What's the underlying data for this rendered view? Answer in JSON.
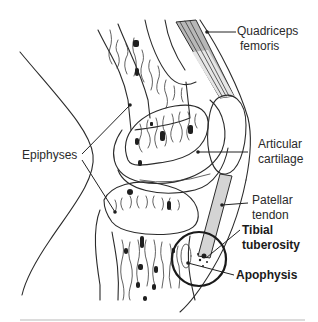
{
  "diagram": {
    "type": "anatomical illustration",
    "labels": {
      "quadriceps": [
        "Quadriceps",
        "femoris"
      ],
      "articular": [
        "Articular",
        "cartilage"
      ],
      "epiphyses": "Epiphyses",
      "patellar": [
        "Patellar",
        "tendon"
      ],
      "tibial": [
        "Tibial",
        "tuberosity"
      ],
      "apophysis": "Apophysis"
    },
    "colors": {
      "line": "#2b2b2b",
      "muscle_fill": "#b8b8b8",
      "tendon_fill": "#d4d4d4",
      "background": "#ffffff",
      "bottom_rule": "#d0d0d0"
    }
  }
}
